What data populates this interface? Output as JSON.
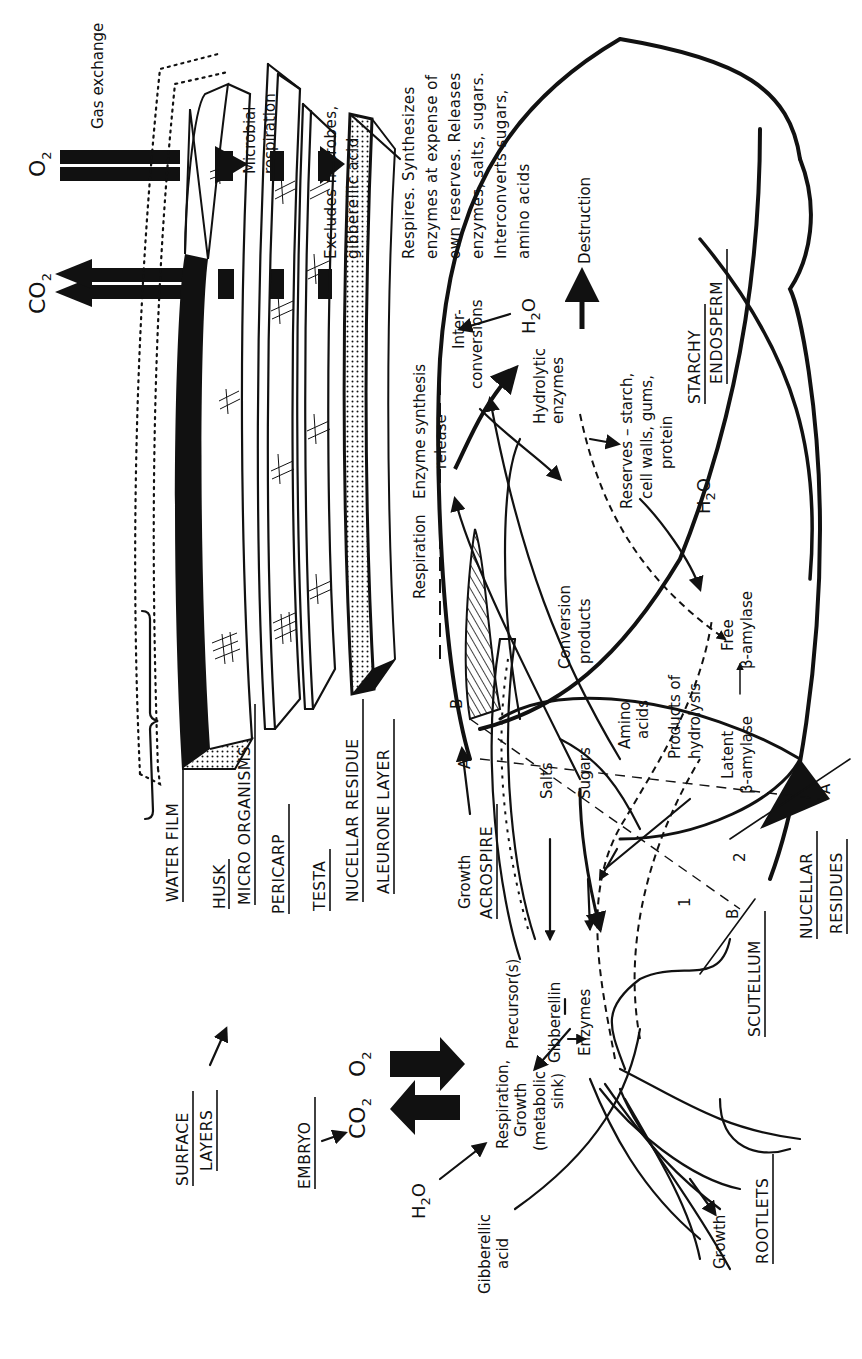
{
  "diagram": {
    "orientation": "rotated 90° counter-clockwise",
    "surface_layers": {
      "title_line1": "SURFACE",
      "title_line2": "LAYERS",
      "layers": [
        "WATER FILM",
        "HUSK",
        "MICRO ORGANISMS",
        "PERICARP",
        "TESTA",
        "NUCELLAR RESIDUE",
        "ALEURONE LAYER"
      ],
      "note_microbial_1": "Microbial",
      "note_microbial_2": "respiration",
      "note_testa_1": "Excludes microbes,",
      "note_testa_2": "gibberellic acid",
      "aleurone_note": [
        "Respires. Synthesizes",
        "enzymes at expense of",
        "own reserves. Releases",
        "enzymes, salts, sugars.",
        "Interconverts sugars,",
        "amino acids"
      ]
    },
    "gas": {
      "co2": "CO",
      "o2": "O",
      "subscript": "2",
      "gas_exchange": "Gas exchange"
    },
    "embryo": {
      "title": "EMBRYO",
      "co2": "CO",
      "o2": "O",
      "subscript": "2",
      "water_h": "H",
      "water_sub": "2",
      "water_o": "O",
      "gibberellic_1": "Gibberellic",
      "gibberellic_2": "acid",
      "respiration_1": "Respiration,",
      "respiration_2": "Growth",
      "respiration_3": "(metabolic",
      "respiration_4": "sink)",
      "precursor": "Precursor(s)",
      "gibberellin": "Gibberellin",
      "enzymes": "Enzymes",
      "acrospire_growth": "Growth",
      "acrospire": "ACROSPIRE",
      "rootlets_growth": "Growth",
      "rootlets": "ROOTLETS",
      "scutellum": "SCUTELLUM",
      "line1": "1",
      "line2": "2"
    },
    "aleurone_flow": {
      "respiration": "Respiration",
      "enzyme_synthesis": "Enzyme synthesis",
      "release": "release",
      "inter_1": "Inter-",
      "inter_2": "conversions",
      "h2o_h": "H",
      "h2o_sub": "2",
      "h2o_o": "O",
      "destruction": "Destruction"
    },
    "endosperm": {
      "title_1": "STARCHY",
      "title_2": "ENDOSPERM",
      "hydrolytic_1": "Hydrolytic",
      "hydrolytic_2": "enzymes",
      "reserves_1": "Reserves – starch,",
      "reserves_2": "cell walls, gums,",
      "reserves_3": "protein",
      "conversion_1": "Conversion",
      "conversion_2": "products",
      "products_1": "Products of",
      "products_2": "hydrolysis",
      "free_1": "Free",
      "free_2": "β-amylase",
      "latent_1": "Latent",
      "latent_2": "β-amylase",
      "h2o_h": "H",
      "h2o_sub": "2",
      "h2o_o": "O",
      "salts": "Salts",
      "sugars": "Sugars",
      "amino_1": "Amino",
      "amino_2": "acids"
    },
    "nucellar": {
      "title_1": "NUCELLAR",
      "title_2": "RESIDUES",
      "a_top": "A",
      "a_bottom": "A",
      "b_top": "B",
      "b_bottom": "B"
    }
  }
}
